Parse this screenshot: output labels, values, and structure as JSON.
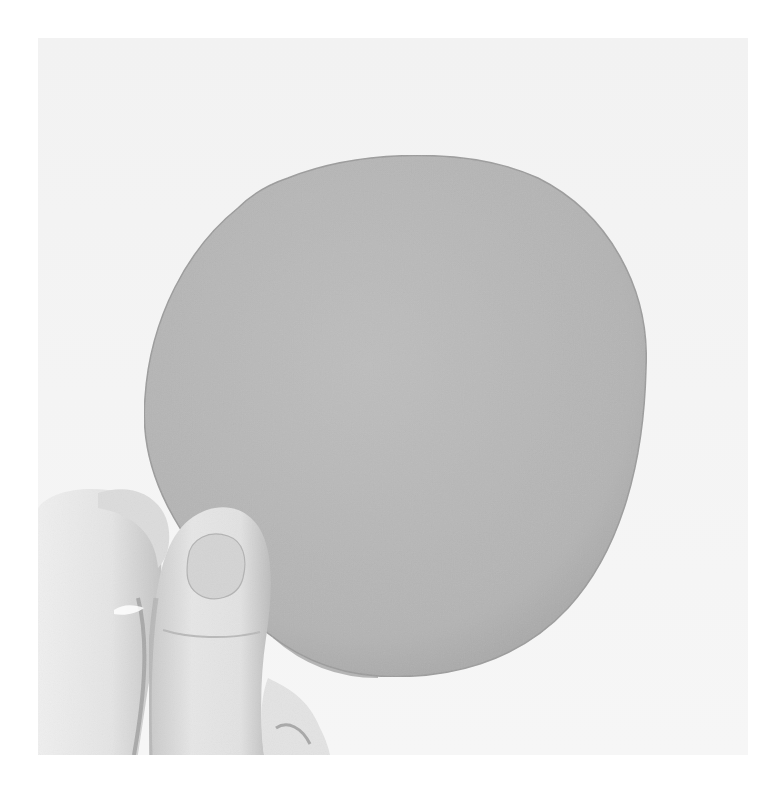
{
  "image": {
    "alt": "Black-and-white photo of a hand holding a round gray disc against a light background",
    "subject": "round gray disc held between thumb and index finger",
    "colors": {
      "page_background": "#ffffff",
      "photo_background": "#f4f4f4",
      "disc_fill": "#b9b9b9",
      "disc_edge": "#8e8e8e",
      "skin_light": "#ececec",
      "skin_mid": "#d9d9d9",
      "skin_shadow": "#a9a9a9",
      "nail": "#cfcfcf"
    }
  }
}
